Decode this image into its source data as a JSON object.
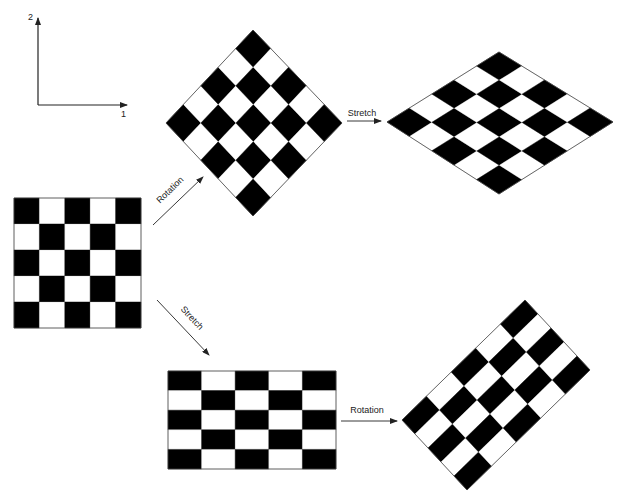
{
  "axes": {
    "x_label": "1",
    "y_label": "2",
    "origin": [
      38,
      105
    ],
    "x_end": [
      127,
      105
    ],
    "y_end": [
      38,
      18
    ]
  },
  "colors": {
    "dark": "#000000",
    "light": "#ffffff",
    "line": "#444444"
  },
  "grid_size": 5,
  "boards": [
    {
      "name": "original-square",
      "corners": {
        "tl": [
          14,
          198
        ],
        "tr": [
          141,
          198
        ],
        "br": [
          141,
          328
        ],
        "bl": [
          14,
          328
        ]
      }
    },
    {
      "name": "rotated-square",
      "corners": {
        "tl": [
          166,
          123
        ],
        "tr": [
          253,
          30
        ],
        "br": [
          342,
          123
        ],
        "bl": [
          253,
          216
        ]
      }
    },
    {
      "name": "rotated-then-stretched",
      "corners": {
        "tl": [
          387,
          122
        ],
        "tr": [
          499,
          52
        ],
        "br": [
          613,
          122
        ],
        "bl": [
          499,
          194
        ]
      }
    },
    {
      "name": "stretched-rectangle",
      "corners": {
        "tl": [
          168,
          371
        ],
        "tr": [
          336,
          371
        ],
        "br": [
          336,
          469
        ],
        "bl": [
          168,
          469
        ]
      }
    },
    {
      "name": "stretched-then-rotated",
      "corners": {
        "tl": [
          402,
          420
        ],
        "tr": [
          525,
          300
        ],
        "br": [
          590,
          370
        ],
        "bl": [
          467,
          490
        ]
      }
    }
  ],
  "arrows": [
    {
      "name": "rotation-arrow-upper",
      "label": "Rotation",
      "from": [
        153,
        225
      ],
      "to": [
        203,
        177
      ],
      "label_pos": [
        172,
        192
      ],
      "angle": -44
    },
    {
      "name": "stretch-arrow-upper",
      "label": "Stretch",
      "from": [
        347,
        121
      ],
      "to": [
        381,
        121
      ],
      "label_pos": [
        362,
        116
      ],
      "angle": 0
    },
    {
      "name": "stretch-arrow-lower",
      "label": "Stretch",
      "from": [
        157,
        300
      ],
      "to": [
        209,
        355
      ],
      "label_pos": [
        190,
        320
      ],
      "angle": 47
    },
    {
      "name": "rotation-arrow-lower",
      "label": "Rotation",
      "from": [
        341,
        421
      ],
      "to": [
        397,
        421
      ],
      "label_pos": [
        367,
        413
      ],
      "angle": 0
    }
  ]
}
